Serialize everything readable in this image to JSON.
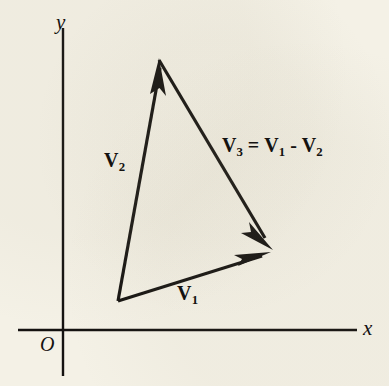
{
  "figure": {
    "type": "vector-diagram",
    "background_color": "#f4f1e6",
    "ink_color": "#141210",
    "width": 389,
    "height": 386
  },
  "axes": {
    "x_label": "x",
    "y_label": "y",
    "origin_label": "O",
    "origin_px": {
      "x": 63,
      "y": 330
    },
    "x_axis": {
      "x1": 18,
      "y1": 330,
      "x2": 357,
      "y2": 330
    },
    "y_axis": {
      "x1": 63,
      "y1": 28,
      "x2": 63,
      "y2": 376
    }
  },
  "vectors": [
    {
      "name": "V1",
      "label": "V",
      "subscript": "1",
      "tail": {
        "x": 118,
        "y": 301
      },
      "head": {
        "x": 270,
        "y": 253
      }
    },
    {
      "name": "V2",
      "label": "V",
      "subscript": "2",
      "tail": {
        "x": 118,
        "y": 301
      },
      "head": {
        "x": 159,
        "y": 60
      }
    },
    {
      "name": "V3",
      "label": "V",
      "subscript": "3",
      "tail": {
        "x": 159,
        "y": 60
      },
      "head": {
        "x": 272,
        "y": 249
      }
    }
  ],
  "equation": {
    "lhs": "V",
    "lhs_sub": "3",
    "operator_equals": "=",
    "term1": "V",
    "term1_sub": "1",
    "operator_minus": "-",
    "term2": "V",
    "term2_sub": "2",
    "full_text": "V3 = V1 - V2"
  }
}
